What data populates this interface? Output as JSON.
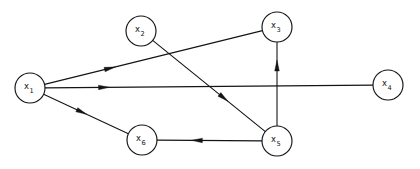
{
  "figure": {
    "width": 420,
    "height": 169,
    "background_color": "#ffffff",
    "line_color": "#141414"
  },
  "nodes": [
    {
      "id": "x1",
      "base": "x",
      "sub": "1",
      "cx": 30,
      "cy": 88,
      "r": 15
    },
    {
      "id": "x2",
      "base": "x",
      "sub": "2",
      "cx": 141,
      "cy": 31,
      "r": 15
    },
    {
      "id": "x3",
      "base": "x",
      "sub": "3",
      "cx": 277,
      "cy": 27,
      "r": 15
    },
    {
      "id": "x4",
      "base": "x",
      "sub": "4",
      "cx": 388,
      "cy": 85,
      "r": 15
    },
    {
      "id": "x5",
      "base": "x",
      "sub": "5",
      "cx": 277,
      "cy": 141,
      "r": 15
    },
    {
      "id": "x6",
      "base": "x",
      "sub": "6",
      "cx": 142,
      "cy": 140,
      "r": 15
    }
  ],
  "edges": [
    {
      "id": "e-x1-x3",
      "from": "x1",
      "to": "x3",
      "directed": true,
      "arrow_t": 0.3
    },
    {
      "id": "e-x1-x4",
      "from": "x1",
      "to": "x4",
      "directed": true,
      "arrow_t": 0.18
    },
    {
      "id": "e-x1-x6",
      "from": "x1",
      "to": "x6",
      "directed": true,
      "arrow_t": 0.45
    },
    {
      "id": "e-x2-x5",
      "from": "x2",
      "to": "x5",
      "directed": true,
      "arrow_t": 0.63
    },
    {
      "id": "e-x5-x6",
      "from": "x5",
      "to": "x6",
      "directed": true,
      "arrow_t": 0.62
    },
    {
      "id": "e-x5-x3",
      "from": "x5",
      "to": "x3",
      "directed": true,
      "arrow_t": 0.72
    }
  ],
  "arrow": {
    "length": 11,
    "width": 4.6
  }
}
